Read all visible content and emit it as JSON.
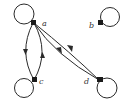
{
  "graph": {
    "type": "directed-graph",
    "nodes": [
      {
        "id": "a",
        "label": "a"
      },
      {
        "id": "b",
        "label": "b"
      },
      {
        "id": "c",
        "label": "c"
      },
      {
        "id": "d",
        "label": "d"
      }
    ],
    "edges": [
      {
        "from": "a",
        "to": "a",
        "kind": "loop"
      },
      {
        "from": "b",
        "to": "b",
        "kind": "loop"
      },
      {
        "from": "c",
        "to": "c",
        "kind": "loop"
      },
      {
        "from": "d",
        "to": "d",
        "kind": "loop"
      },
      {
        "from": "a",
        "to": "c"
      },
      {
        "from": "c",
        "to": "a"
      },
      {
        "from": "a",
        "to": "d"
      },
      {
        "from": "d",
        "to": "a"
      }
    ],
    "colors": {
      "stroke": "#2a2a2a",
      "background": "#ffffff"
    }
  }
}
